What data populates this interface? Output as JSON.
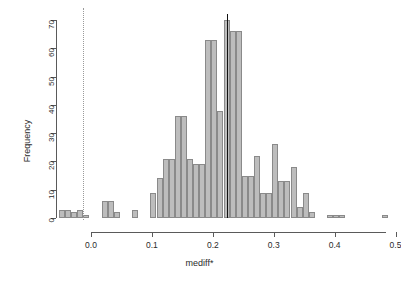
{
  "chart_data": {
    "type": "bar",
    "title": "",
    "subtitle": "",
    "xlabel": "mediff*",
    "ylabel": "Frequency",
    "xlim": [
      -0.045,
      0.505
    ],
    "ylim": [
      0,
      70
    ],
    "xticks": [
      0.0,
      0.1,
      0.2,
      0.3,
      0.4,
      0.5
    ],
    "xticklabels": [
      "0.0",
      "0.1",
      "0.2",
      "0.3",
      "0.4",
      "0.5"
    ],
    "yticks": [
      0,
      10,
      20,
      30,
      40,
      50,
      60,
      70
    ],
    "yticklabels": [
      "0",
      "10",
      "20",
      "30",
      "40",
      "50",
      "60",
      "70"
    ],
    "grid": false,
    "legend": null,
    "bin_width": 0.01,
    "bar_fill": "#bdbdbd",
    "bar_edge": "#8a8a8a",
    "bin_starts": [
      -0.04,
      -0.03,
      -0.02,
      -0.01,
      0.0,
      0.01,
      0.02,
      0.03,
      0.04,
      0.05,
      0.06,
      0.07,
      0.08,
      0.09,
      0.1,
      0.11,
      0.12,
      0.13,
      0.14,
      0.15,
      0.16,
      0.17,
      0.18,
      0.19,
      0.2,
      0.21,
      0.22,
      0.23,
      0.24,
      0.25,
      0.26,
      0.27,
      0.28,
      0.29,
      0.3,
      0.31,
      0.32,
      0.33,
      0.34,
      0.35,
      0.36,
      0.37,
      0.38,
      0.39,
      0.4,
      0.41,
      0.42,
      0.43,
      0.44,
      0.45,
      0.46,
      0.47,
      0.48,
      0.49
    ],
    "values": [
      3,
      3,
      2,
      3,
      1,
      0,
      0,
      6,
      6,
      2,
      0,
      0,
      3,
      0,
      0,
      9,
      14,
      21,
      21,
      36,
      36,
      21,
      19,
      19,
      63,
      63,
      38,
      70,
      66,
      66,
      15,
      15,
      22,
      9,
      9,
      26,
      13,
      13,
      18,
      4,
      9,
      2,
      0,
      0,
      1,
      1,
      1,
      0,
      0,
      0,
      0,
      0,
      0,
      1
    ],
    "annotations": [
      {
        "name": "zero-reference-line",
        "type": "vline",
        "x": 0.0,
        "style": "dotted",
        "color": "#9a9a9a"
      },
      {
        "name": "observed-statistic-line",
        "type": "vline",
        "x": 0.236,
        "style": "solid",
        "color": "#111111"
      }
    ]
  },
  "figure": {
    "background": "#ffffff",
    "axis_color": "#5a5a5a"
  }
}
